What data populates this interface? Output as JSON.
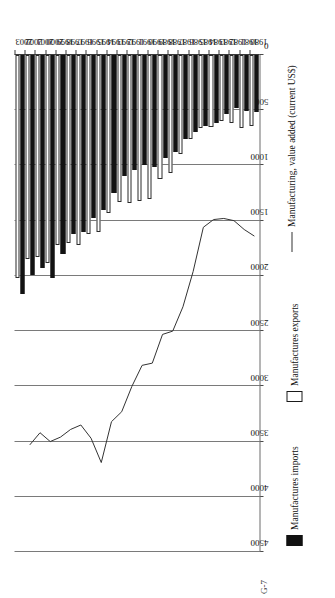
{
  "page": {
    "corner_label": "G-7",
    "background": "#ffffff"
  },
  "legend": {
    "items": [
      {
        "key": "imports",
        "label": "Manufactures imports",
        "marker": "filled-square",
        "color": "#111111"
      },
      {
        "key": "exports",
        "label": "Manufactures exports",
        "marker": "hollow-square",
        "color": "#ffffff"
      },
      {
        "key": "value_added",
        "label": "Manufacturing, value added (current US$)",
        "marker": "line",
        "color": "#333333"
      }
    ]
  },
  "axis": {
    "value_ticks": [
      "4500",
      "4000",
      "3500",
      "3000",
      "2500",
      "2000",
      "1500",
      "1000",
      "500",
      "0"
    ],
    "value_min": 0,
    "value_max": 4500,
    "value_step": 500,
    "direction": "right-to-left",
    "grid": true
  },
  "chart_data": {
    "type": "bar",
    "title": "",
    "subtitle": "",
    "xlabel": "",
    "ylabel": "",
    "orientation": "horizontal",
    "grid": true,
    "legend_position": "right",
    "xlim": [
      0,
      4500
    ],
    "categories": [
      "1980",
      "1981",
      "1982",
      "1983",
      "1984",
      "1985",
      "1986",
      "1987",
      "1988",
      "1989",
      "1990",
      "1991",
      "1992",
      "1993",
      "1994",
      "1995",
      "1996",
      "1997",
      "1998",
      "1999",
      "2000",
      "2001",
      "2002",
      "2003"
    ],
    "series": [
      {
        "name": "Manufactures imports",
        "type": "bar",
        "color": "#111111",
        "values": [
          520,
          510,
          480,
          530,
          620,
          640,
          700,
          760,
          880,
          930,
          1010,
          1000,
          1040,
          1100,
          1250,
          1400,
          1480,
          1600,
          1620,
          1800,
          2020,
          1930,
          1990,
          2160
        ]
      },
      {
        "name": "Manufactures exports",
        "type": "bar",
        "color": "#ffffff",
        "values": [
          640,
          660,
          620,
          600,
          650,
          660,
          760,
          900,
          1070,
          1120,
          1300,
          1320,
          1340,
          1330,
          1430,
          1600,
          1620,
          1720,
          1700,
          1720,
          1880,
          1830,
          1850,
          2020
        ]
      },
      {
        "name": "Manufacturing, value added (current US$)",
        "type": "line",
        "color": "#333333",
        "values": [
          1640,
          1580,
          1500,
          1480,
          1490,
          1560,
          1960,
          2280,
          2500,
          2530,
          2790,
          2810,
          3000,
          3230,
          3320,
          3690,
          3470,
          3350,
          3390,
          3460,
          3500,
          3420,
          3530,
          null
        ]
      }
    ]
  }
}
